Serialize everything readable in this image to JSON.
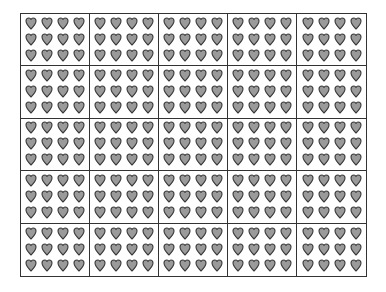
{
  "diagram": {
    "type": "array-grid",
    "rows": 5,
    "columns": 5,
    "cell": {
      "heart_rows": 3,
      "heart_columns": 4,
      "hearts_per_cell": 12
    },
    "total_cells": 25,
    "total_hearts": 300,
    "icon": "heart-icon",
    "colors": {
      "heart_fill": "#9a9a9a",
      "heart_stroke": "#3a3a3a",
      "grid_line": "#333333",
      "background": "#ffffff"
    }
  }
}
